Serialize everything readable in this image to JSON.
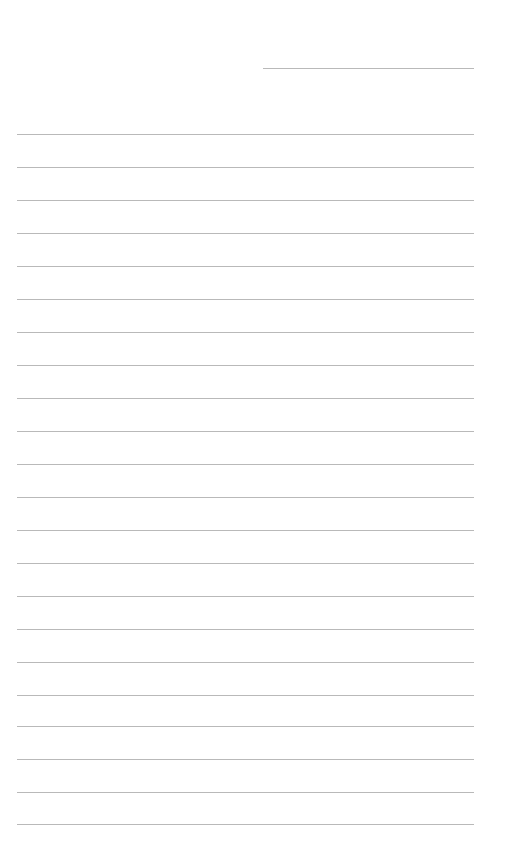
{
  "document": {
    "type": "lined-paper",
    "date_line": {
      "text": ""
    },
    "lines": [
      {
        "top": 134,
        "text": ""
      },
      {
        "top": 167,
        "text": ""
      },
      {
        "top": 200,
        "text": ""
      },
      {
        "top": 233,
        "text": ""
      },
      {
        "top": 266,
        "text": ""
      },
      {
        "top": 299,
        "text": ""
      },
      {
        "top": 332,
        "text": ""
      },
      {
        "top": 365,
        "text": ""
      },
      {
        "top": 398,
        "text": ""
      },
      {
        "top": 431,
        "text": ""
      },
      {
        "top": 464,
        "text": ""
      },
      {
        "top": 497,
        "text": ""
      },
      {
        "top": 530,
        "text": ""
      },
      {
        "top": 563,
        "text": ""
      },
      {
        "top": 596,
        "text": ""
      },
      {
        "top": 629,
        "text": ""
      },
      {
        "top": 662,
        "text": ""
      },
      {
        "top": 695,
        "text": ""
      },
      {
        "top": 726,
        "text": ""
      },
      {
        "top": 759,
        "text": ""
      },
      {
        "top": 792,
        "text": ""
      },
      {
        "top": 824,
        "text": ""
      }
    ],
    "line_color": "#b9b9b9",
    "background_color": "#ffffff"
  }
}
